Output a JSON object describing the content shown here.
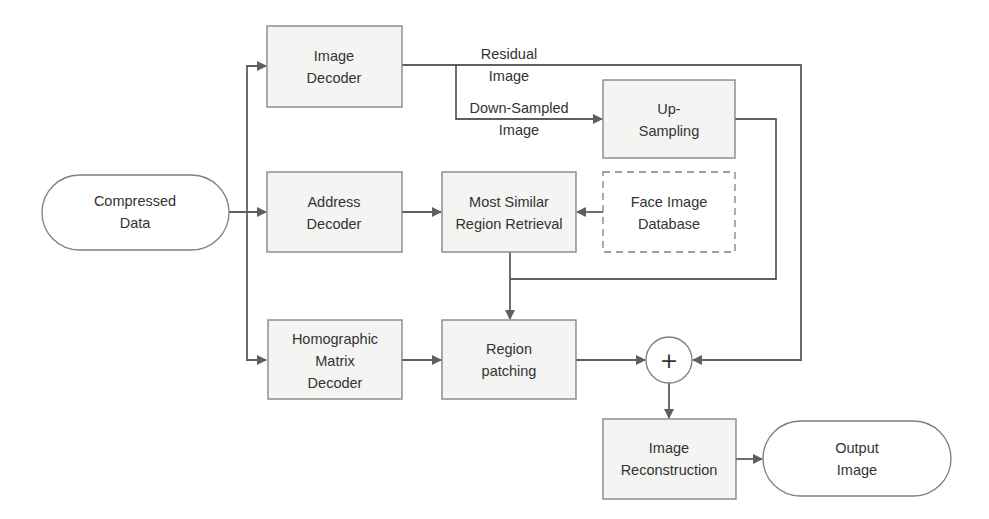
{
  "diagram": {
    "nodes": {
      "compressed_data": {
        "line1": "Compressed",
        "line2": "Data"
      },
      "image_decoder": {
        "line1": "Image",
        "line2": "Decoder"
      },
      "address_decoder": {
        "line1": "Address",
        "line2": "Decoder"
      },
      "homographic_decoder": {
        "line1": "Homographic",
        "line2": "Matrix",
        "line3": "Decoder"
      },
      "up_sampling": {
        "line1": "Up-",
        "line2": "Sampling"
      },
      "most_similar": {
        "line1": "Most Similar",
        "line2": "Region Retrieval"
      },
      "face_db": {
        "line1": "Face Image",
        "line2": "Database"
      },
      "region_patching": {
        "line1": "Region",
        "line2": "patching"
      },
      "sum": {
        "symbol": "+"
      },
      "image_reconstruction": {
        "line1": "Image",
        "line2": "Reconstruction"
      },
      "output_image": {
        "line1": "Output",
        "line2": "Image"
      }
    },
    "edge_labels": {
      "residual": {
        "line1": "Residual",
        "line2": "Image"
      },
      "downsampled": {
        "line1": "Down-Sampled",
        "line2": "Image"
      }
    },
    "colors": {
      "stroke": "#7f7f7f",
      "edge": "#5f5f5f",
      "box_fill": "#f4f4f2",
      "text": "#333333"
    }
  }
}
